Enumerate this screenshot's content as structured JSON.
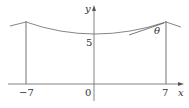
{
  "diagram": {
    "axes": {
      "x_label": "x",
      "y_label": "y"
    },
    "ticks": {
      "x_left": "−7",
      "origin": "0",
      "x_right": "7",
      "y_mark": "5"
    },
    "angle_label": "θ",
    "colors": {
      "axes": "#555555",
      "poles": "#999999",
      "cable": "#666666",
      "tangent": "#555555",
      "text": "#333333"
    }
  }
}
